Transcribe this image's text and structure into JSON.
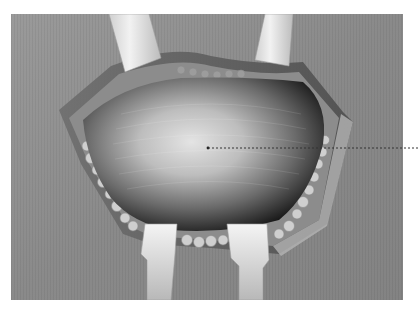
{
  "figure": {
    "palette": {
      "background": "#ffffff",
      "drape": "#8e8e8e",
      "drape_dark": "#7a7a7a",
      "wound_edge": "#5c5c5c",
      "fat_globules": "#c9c9c9",
      "cavity_dark": "#1c1c1c",
      "cavity_light": "#d8d8d8",
      "retractor_blade": "#e8e8e8",
      "leader_line": "#333333"
    },
    "leader_line": {
      "x1": 208,
      "y1": 148,
      "x2": 419,
      "y2": 148,
      "style": "dotted"
    }
  }
}
